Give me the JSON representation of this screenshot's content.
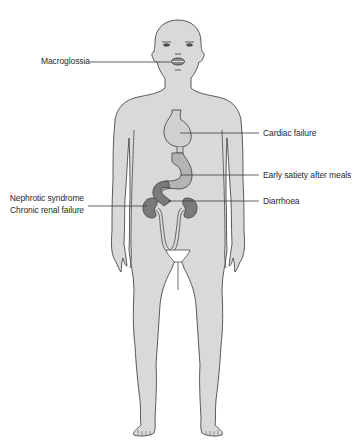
{
  "diagram": {
    "colors": {
      "body_fill": "#d9d9d9",
      "outline": "#4a4a4a",
      "stomach_fill": "#b4b4b4",
      "duodenum_fill": "#7a7a7a",
      "kidney_fill": "#7a7a7a",
      "heart_fill": "#d0d0d0",
      "leader_line": "#3a3a3a",
      "text": "#2a2a2a"
    },
    "labels": {
      "macroglossia": "Macroglossia",
      "cardiac_failure": "Cardiac failure",
      "early_satiety": "Early satiety after meals",
      "diarrhoea": "Diarrhoea",
      "nephrotic_syndrome": "Nephrotic syndrome",
      "chronic_renal_failure": "Chronic renal failure"
    },
    "annotations": [
      {
        "label": "Macroglossia",
        "target": "tongue/mouth",
        "side": "left"
      },
      {
        "label": "Cardiac failure",
        "target": "heart",
        "side": "right"
      },
      {
        "label": "Early satiety after meals",
        "target": "stomach",
        "side": "right"
      },
      {
        "label": "Diarrhoea",
        "target": "intestine/duodenum",
        "side": "right"
      },
      {
        "label": "Nephrotic syndrome",
        "target": "kidney",
        "side": "left"
      },
      {
        "label": "Chronic renal failure",
        "target": "kidney",
        "side": "left"
      }
    ]
  }
}
